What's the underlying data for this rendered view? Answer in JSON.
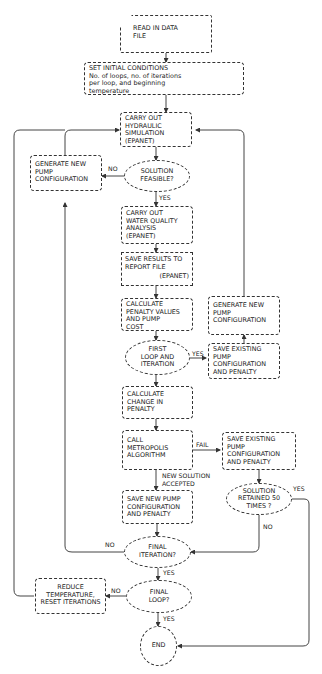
{
  "diagram": {
    "type": "flowchart",
    "nodes": {
      "read_data": {
        "lines": [
          "READ IN DATA",
          "FILE"
        ],
        "shape": "document"
      },
      "init": {
        "lines": [
          "SET INITIAL CONDITIONS",
          "No. of loops, no. of iterations",
          "per loop, and beginning",
          "temperature"
        ],
        "shape": "process"
      },
      "hydraulic": {
        "lines": [
          "CARRY OUT",
          "HYDRAULIC",
          "SIMULATION",
          "(EPANET)"
        ],
        "shape": "process"
      },
      "feasible": {
        "lines": [
          "SOLUTION",
          "FEASIBLE?"
        ],
        "shape": "decision"
      },
      "gen_new_left": {
        "lines": [
          "GENERATE NEW",
          "PUMP",
          "CONFIGURATION"
        ],
        "shape": "process"
      },
      "water_quality": {
        "lines": [
          "CARRY OUT",
          "WATER QUALITY",
          "ANALYSIS",
          "(EPANET)"
        ],
        "shape": "process"
      },
      "save_report": {
        "lines": [
          "SAVE RESULTS TO",
          "REPORT FILE"
        ],
        "sub": "(EPANET)",
        "shape": "process"
      },
      "calc_penalty": {
        "lines": [
          "CALCULATE",
          "PENALTY VALUES",
          "AND PUMP",
          "COST"
        ],
        "shape": "process"
      },
      "gen_new_right": {
        "lines": [
          "GENERATE NEW",
          "PUMP",
          "CONFIGURATION"
        ],
        "shape": "process"
      },
      "first_loop": {
        "lines": [
          "FIRST",
          "LOOP AND",
          "ITERATION"
        ],
        "shape": "decision"
      },
      "save_existing_1": {
        "lines": [
          "SAVE EXISTING",
          "PUMP",
          "CONFIGURATION",
          "AND PENALTY"
        ],
        "shape": "process"
      },
      "calc_change": {
        "lines": [
          "CALCULATE",
          "CHANGE IN",
          "PENALTY"
        ],
        "shape": "process"
      },
      "metropolis": {
        "lines": [
          "CALL",
          "METROPOLIS",
          "ALGORITHM"
        ],
        "shape": "process"
      },
      "save_existing_2": {
        "lines": [
          "SAVE EXISTING",
          "PUMP",
          "CONFIGURATION",
          "AND PENALTY"
        ],
        "shape": "process"
      },
      "save_new": {
        "lines": [
          "SAVE NEW PUMP",
          "CONFIGURATION",
          "AND PENALTY"
        ],
        "shape": "process"
      },
      "retained": {
        "lines": [
          "SOLUTION",
          "RETAINED 50",
          "TIMES ?"
        ],
        "shape": "decision"
      },
      "final_iter": {
        "lines": [
          "FINAL",
          "ITERATION?"
        ],
        "shape": "decision"
      },
      "reduce_temp": {
        "lines": [
          "REDUCE",
          "TEMPERATURE,",
          "RESET ITERATIONS"
        ],
        "shape": "process"
      },
      "final_loop": {
        "lines": [
          "FINAL",
          "LOOP?"
        ],
        "shape": "decision"
      },
      "end": {
        "lines": [
          "END"
        ],
        "shape": "terminal"
      }
    },
    "edge_labels": {
      "feasible_no": "NO",
      "feasible_yes": "YES",
      "first_loop_yes": "YES",
      "metropolis_fail": "FAIL",
      "accepted_1": "NEW SOLUTION",
      "accepted_2": "ACCEPTED",
      "retained_yes": "YES",
      "retained_no": "NO",
      "final_iter_no": "NO",
      "final_iter_yes": "YES",
      "final_loop_no": "NO",
      "final_loop_yes": "YES"
    },
    "edges": [
      [
        "read_data",
        "init"
      ],
      [
        "init",
        "hydraulic"
      ],
      [
        "hydraulic",
        "feasible"
      ],
      [
        "feasible",
        "gen_new_left",
        "NO"
      ],
      [
        "gen_new_left",
        "hydraulic"
      ],
      [
        "feasible",
        "water_quality",
        "YES"
      ],
      [
        "water_quality",
        "save_report"
      ],
      [
        "save_report",
        "calc_penalty"
      ],
      [
        "calc_penalty",
        "first_loop"
      ],
      [
        "first_loop",
        "save_existing_1",
        "YES"
      ],
      [
        "save_existing_1",
        "gen_new_right"
      ],
      [
        "gen_new_right",
        "hydraulic"
      ],
      [
        "first_loop",
        "calc_change"
      ],
      [
        "calc_change",
        "metropolis"
      ],
      [
        "metropolis",
        "save_existing_2",
        "FAIL"
      ],
      [
        "metropolis",
        "save_new",
        "NEW SOLUTION ACCEPTED"
      ],
      [
        "save_existing_2",
        "retained"
      ],
      [
        "retained",
        "end",
        "YES"
      ],
      [
        "retained",
        "final_iter",
        "NO"
      ],
      [
        "save_new",
        "final_iter"
      ],
      [
        "final_iter",
        "gen_new_left",
        "NO"
      ],
      [
        "final_iter",
        "final_loop",
        "YES"
      ],
      [
        "final_loop",
        "reduce_temp",
        "NO"
      ],
      [
        "reduce_temp",
        "hydraulic"
      ],
      [
        "final_loop",
        "end",
        "YES"
      ]
    ]
  }
}
